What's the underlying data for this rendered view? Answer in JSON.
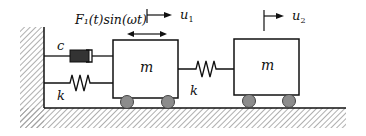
{
  "diagram": {
    "type": "two-mass spring-damper system",
    "labels": {
      "damper": "c",
      "spring_wall": "k",
      "spring_coupling": "k",
      "mass1": "m",
      "mass2": "m",
      "force": "F₁(t)sin(ωt)",
      "disp1": "u",
      "disp1_sub": "1",
      "disp2": "u",
      "disp2_sub": "2"
    },
    "colors": {
      "line": "#111111",
      "damper_fill": "#333333",
      "wheel_fill": "#8c8c8c",
      "hatch": "#9a9a9a"
    }
  }
}
